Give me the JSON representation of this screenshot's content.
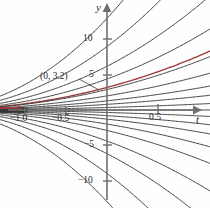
{
  "figure": {
    "name": "solution-curve-family-plot",
    "background": "#fefefe"
  },
  "axes": {
    "x_axis_label": "t",
    "y_axis_label": "y",
    "x_ticks": [
      {
        "label": "−1.0",
        "value": -1.0
      },
      {
        "label": "−0.5",
        "value": -0.5
      },
      {
        "label": "0.5",
        "value": 0.5
      }
    ],
    "y_ticks": [
      {
        "label": "10",
        "value": 10
      },
      {
        "label": "5",
        "value": 5
      },
      {
        "label": "−5",
        "value": -5
      },
      {
        "label": "−10",
        "value": -10
      }
    ],
    "axis_color": "#6f6f6f"
  },
  "annotations": [
    {
      "name": "point-label",
      "text": "(0, 3.2)",
      "x_value": 0,
      "y_value": 3.2
    }
  ],
  "colors": {
    "curve": "#3a3a3a",
    "highlight": "#9e3b3b",
    "axis": "#6f6f6f",
    "text": "#2b2b2b"
  },
  "chart_data": {
    "type": "line",
    "title": "",
    "xlabel": "t",
    "ylabel": "y",
    "xlim": [
      -1.12,
      0.92
    ],
    "ylim": [
      -13.5,
      14.5
    ],
    "grid": false,
    "legend": null,
    "highlight_series": {
      "name": "solution through (0, 3.2)",
      "color": "#9e3b3b",
      "passes_through": {
        "t": 0,
        "y": 3.2
      }
    },
    "series": [
      {
        "name": "c1",
        "color": "#3a3a3a",
        "c": 13.0
      },
      {
        "name": "c2",
        "color": "#3a3a3a",
        "c": 9.0
      },
      {
        "name": "c3",
        "color": "#3a3a3a",
        "c": 6.2
      },
      {
        "name": "c4",
        "color": "#3a3a3a",
        "c": 4.4
      },
      {
        "name": "c5",
        "color": "#9e3b3b",
        "c": 3.2
      },
      {
        "name": "c6",
        "color": "#3a3a3a",
        "c": 2.9
      },
      {
        "name": "c7",
        "color": "#3a3a3a",
        "c": 2.0
      },
      {
        "name": "c8",
        "color": "#3a3a3a",
        "c": 1.3
      },
      {
        "name": "c9",
        "color": "#3a3a3a",
        "c": 0.8
      },
      {
        "name": "c10",
        "color": "#3a3a3a",
        "c": 0.35
      },
      {
        "name": "c11",
        "color": "#3a3a3a",
        "c": 0.0
      },
      {
        "name": "c12",
        "color": "#3a3a3a",
        "c": -0.35
      },
      {
        "name": "c13",
        "color": "#3a3a3a",
        "c": -0.8
      },
      {
        "name": "c14",
        "color": "#3a3a3a",
        "c": -1.3
      },
      {
        "name": "c15",
        "color": "#3a3a3a",
        "c": -2.0
      },
      {
        "name": "c16",
        "color": "#3a3a3a",
        "c": -2.9
      },
      {
        "name": "c17",
        "color": "#3a3a3a",
        "c": -4.4
      },
      {
        "name": "c18",
        "color": "#3a3a3a",
        "c": -6.2
      },
      {
        "name": "c19",
        "color": "#3a3a3a",
        "c": -9.0
      },
      {
        "name": "c20",
        "color": "#3a3a3a",
        "c": -13.0
      }
    ]
  }
}
